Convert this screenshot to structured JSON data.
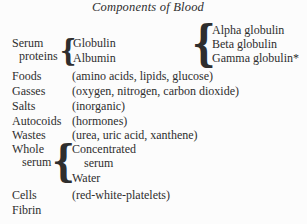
{
  "title": "Components of Blood",
  "colors": {
    "background": "#fcfcfc",
    "text": "#2e2e2e"
  },
  "serum_proteins": {
    "label_line1": "Serum",
    "label_line2": "proteins",
    "brace": "{",
    "items": [
      "Globulin",
      "Albumin"
    ],
    "globulins_brace": "{",
    "globulins": [
      "Alpha globulin",
      "Beta globulin",
      "Gamma globulin*"
    ]
  },
  "rows": [
    {
      "label": "Foods",
      "value": "(amino acids, lipids, glucose)"
    },
    {
      "label": "Gasses",
      "value": "(oxygen, nitrogen, carbon dioxide)"
    },
    {
      "label": "Salts",
      "value": "(inorganic)"
    },
    {
      "label": "Autocoids",
      "value": "(hormones)"
    },
    {
      "label": "Wastes",
      "value": "(urea, uric acid, xanthene)"
    }
  ],
  "whole_serum": {
    "label_line1": "Whole",
    "label_line2": "serum",
    "brace": "{",
    "item1_line1": "Concentrated",
    "item1_line2": "serum",
    "item2": "Water"
  },
  "cells": {
    "label": "Cells",
    "value": "(red-white-platelets)"
  },
  "fibrin": {
    "label": "Fibrin"
  }
}
